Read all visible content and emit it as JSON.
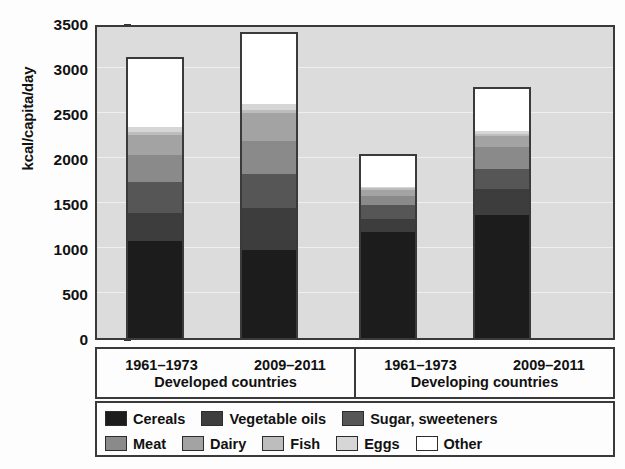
{
  "chart_data": {
    "type": "bar",
    "subtype": "stacked-bar",
    "title": "",
    "xlabel": "",
    "ylabel": "kcal/capita/day",
    "ylim": [
      0,
      3500
    ],
    "yticks": [
      0,
      500,
      1000,
      1500,
      2000,
      2500,
      3000,
      3500
    ],
    "ytick_labels": [
      "0",
      "500",
      "1000",
      "1500",
      "2000",
      "2500",
      "3000",
      "3500"
    ],
    "grid": true,
    "legend_position": "below-axis",
    "groups": [
      {
        "name": "Developed countries",
        "periods": [
          "1961–1973",
          "2009–2011"
        ]
      },
      {
        "name": "Developing countries",
        "periods": [
          "1961–1973",
          "2009–2011"
        ]
      }
    ],
    "categories": [
      "Developed countries 1961–1973",
      "Developed countries 2009–2011",
      "Developing countries 1961–1973",
      "Developing countries 2009–2011"
    ],
    "series": [
      {
        "name": "Cereals",
        "color": "#1c1c1c",
        "values": [
          1080,
          980,
          1180,
          1370
        ]
      },
      {
        "name": "Vegetable oils",
        "color": "#3d3d3d",
        "values": [
          310,
          470,
          140,
          290
        ]
      },
      {
        "name": "Sugar, sweeteners",
        "color": "#565656",
        "values": [
          340,
          370,
          160,
          220
        ]
      },
      {
        "name": "Meat",
        "color": "#8a8a8a",
        "values": [
          300,
          370,
          100,
          240
        ]
      },
      {
        "name": "Dairy",
        "color": "#a3a3a3",
        "values": [
          230,
          310,
          70,
          120
        ]
      },
      {
        "name": "Fish",
        "color": "#bdbdbd",
        "values": [
          30,
          35,
          15,
          25
        ]
      },
      {
        "name": "Eggs",
        "color": "#d6d6d6",
        "values": [
          55,
          65,
          15,
          35
        ]
      },
      {
        "name": "Other",
        "color": "#ffffff",
        "values": [
          755,
          780,
          340,
          470
        ]
      }
    ],
    "totals": [
      3100,
      3380,
      2020,
      2770
    ],
    "plot_background": "#dcdcdc",
    "frame_color": "#3a3a3a"
  },
  "legend": {
    "rows": [
      [
        "Cereals",
        "Vegetable oils",
        "Sugar, sweeteners"
      ],
      [
        "Meat",
        "Dairy",
        "Fish",
        "Eggs",
        "Other"
      ]
    ]
  }
}
